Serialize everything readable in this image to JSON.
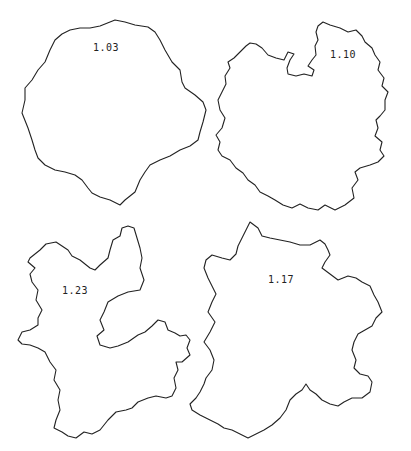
{
  "figure": {
    "shapes": [
      {
        "id": "top-left",
        "label": "1.03"
      },
      {
        "id": "top-right",
        "label": "1.10"
      },
      {
        "id": "bottom-left",
        "label": "1.23"
      },
      {
        "id": "bottom-right",
        "label": "1.17"
      }
    ]
  },
  "colors": {
    "stroke": "#222222",
    "background": "#ffffff"
  }
}
